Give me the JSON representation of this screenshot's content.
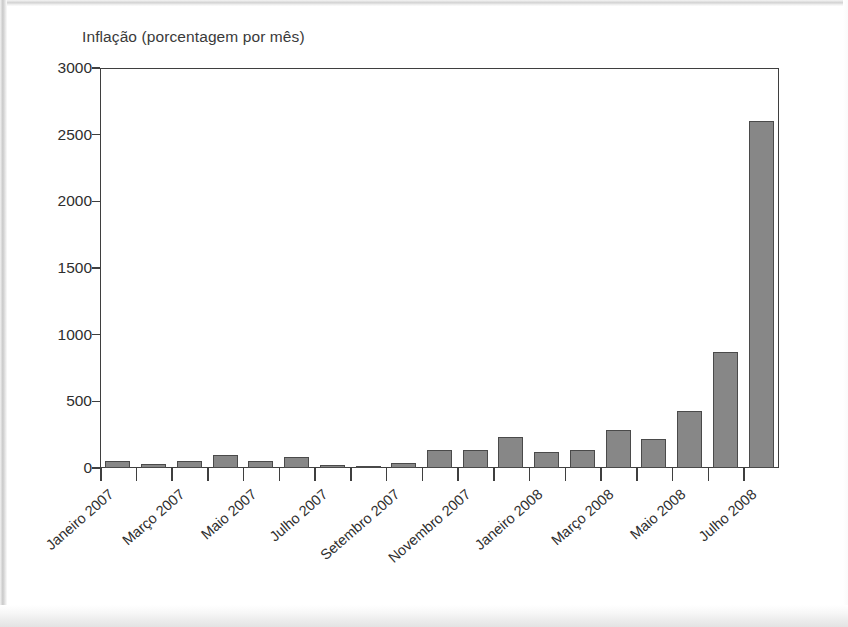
{
  "figure": {
    "title": "Inflação (porcentagem por mês)"
  },
  "chart_data": {
    "type": "bar",
    "title": "Inflação (porcentagem por mês)",
    "xlabel": "",
    "ylabel": "Inflação (porcentagem por mês)",
    "ylim": [
      0,
      3000
    ],
    "yticks": [
      0,
      500,
      1000,
      1500,
      2000,
      2500,
      3000
    ],
    "ytick_labels": [
      "0",
      "500",
      "1000",
      "1500",
      "2000",
      "2500",
      "3000"
    ],
    "grid": false,
    "legend": "none",
    "bar_color": "#878787",
    "bar_edge_color": "#4a4a4a",
    "axis_color": "#3f3f3f",
    "label_every_n": 2,
    "categories": [
      "Janeiro 2007",
      "Fevereiro 2007",
      "Março 2007",
      "Abril 2007",
      "Maio 2007",
      "Junho 2007",
      "Julho 2007",
      "Agosto 2007",
      "Setembro 2007",
      "Outubro 2007",
      "Novembro 2007",
      "Dezembro 2007",
      "Janeiro 2008",
      "Fevereiro 2008",
      "Março 2008",
      "Abril 2008",
      "Maio 2008",
      "Junho 2008",
      "Julho 2008"
    ],
    "tick_labels": [
      "Janeiro 2007",
      "",
      "Março 2007",
      "",
      "Maio 2007",
      "",
      "Julho 2007",
      "",
      "Setembro 2007",
      "",
      "Novembro 2007",
      "",
      "Janeiro 2008",
      "",
      "Março 2008",
      "",
      "Maio 2008",
      "",
      "Julho 2008"
    ],
    "values": [
      50,
      30,
      50,
      100,
      50,
      85,
      25,
      10,
      35,
      135,
      135,
      235,
      120,
      135,
      285,
      215,
      430,
      870,
      2600
    ]
  }
}
